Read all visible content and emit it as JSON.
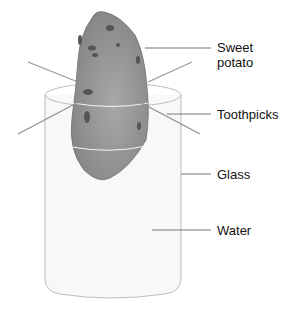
{
  "diagram": {
    "labels": {
      "sweet_potato": [
        "Sweet",
        "potato"
      ],
      "toothpicks": "Toothpicks",
      "glass": "Glass",
      "water": "Water"
    },
    "colors": {
      "potato": "#8a8a8a",
      "potato_spots": "#555555",
      "glass_outline": "#bdbdbd",
      "water": "#f7f7f7",
      "leader_lines": "#777777",
      "text": "#111111"
    }
  }
}
